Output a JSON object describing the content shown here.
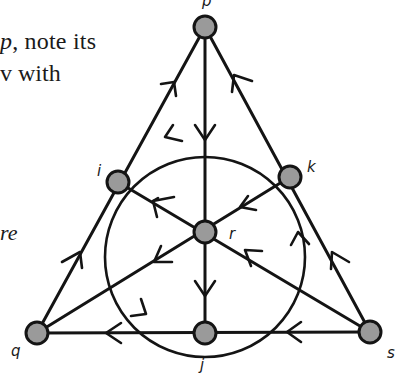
{
  "text_fragments": {
    "line1_var": "p",
    "line1_rest": ", note its",
    "line2": "v with",
    "line3": "re"
  },
  "diagram": {
    "type": "directed Fano-plane style graph",
    "node_fill": "#9a9a9a",
    "stroke_color": "#141414",
    "nodes": [
      {
        "id": "p",
        "label": "p",
        "x": 205,
        "y": 27
      },
      {
        "id": "i",
        "label": "i",
        "x": 118,
        "y": 182
      },
      {
        "id": "k",
        "label": "k",
        "x": 290,
        "y": 177
      },
      {
        "id": "r",
        "label": "r",
        "x": 205,
        "y": 232
      },
      {
        "id": "q",
        "label": "q",
        "x": 37,
        "y": 333
      },
      {
        "id": "j",
        "label": "j",
        "x": 205,
        "y": 333
      },
      {
        "id": "s",
        "label": "s",
        "x": 370,
        "y": 332
      }
    ],
    "edges": [
      {
        "from": "q",
        "to": "i",
        "note": "left side, arrow toward i"
      },
      {
        "from": "i",
        "to": "p",
        "note": "left side, arrow toward p"
      },
      {
        "from": "s",
        "to": "k",
        "note": "right side, arrow toward k"
      },
      {
        "from": "k",
        "to": "p",
        "note": "right side, arrow toward p"
      },
      {
        "from": "s",
        "to": "j",
        "note": "bottom, arrow toward j"
      },
      {
        "from": "j",
        "to": "q",
        "note": "bottom, arrow toward q"
      },
      {
        "from": "p",
        "to": "r",
        "note": "vertical median, arrow down"
      },
      {
        "from": "r",
        "to": "j",
        "note": "vertical median, arrow down"
      },
      {
        "from": "k",
        "to": "r",
        "note": "median from k, arrow toward r"
      },
      {
        "from": "r",
        "to": "q",
        "note": "median toward q, arrow toward q"
      },
      {
        "from": "r",
        "to": "i",
        "note": "median from i, arrow toward i"
      },
      {
        "from": "s",
        "to": "r",
        "note": "median from s, arrow toward r"
      }
    ],
    "circle": {
      "cx": 205,
      "cy": 257,
      "r": 100,
      "arrows": [
        "k→i (top arc, leftward)",
        "i→j (left arc, downward)",
        "j→k (right arc, upward)"
      ]
    }
  }
}
